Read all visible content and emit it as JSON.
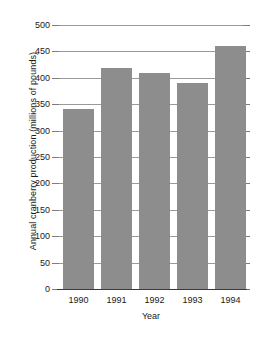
{
  "chart_data": {
    "type": "bar",
    "title": "",
    "xlabel": "Year",
    "ylabel": "Annual cranberry production (millions of pounds)",
    "categories": [
      "1990",
      "1991",
      "1992",
      "1993",
      "1994"
    ],
    "values": [
      340,
      418,
      410,
      390,
      460
    ],
    "series": [
      {
        "name": "Annual cranberry production",
        "values": [
          340,
          418,
          410,
          390,
          460
        ]
      }
    ],
    "ylim": [
      0,
      500
    ],
    "y_ticks": [
      0,
      50,
      100,
      150,
      200,
      250,
      300,
      350,
      400,
      450,
      500
    ],
    "y_tick_labels": [
      "0",
      "50",
      "100",
      "150",
      "200",
      "250",
      "300",
      "350",
      "400",
      "450",
      "500"
    ],
    "grid": true,
    "grid_axis": "y",
    "legend": false,
    "legend_position": "none",
    "bar_color": "#8d8d8d",
    "gridline_color": "#9a9a9a",
    "axis_color": "#3a3a3a",
    "background_color": "#ffffff"
  }
}
